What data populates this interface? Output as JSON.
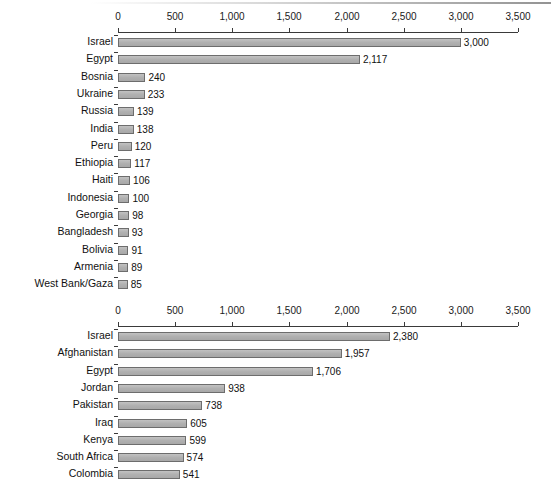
{
  "figure": {
    "background": "#ffffff",
    "bar_fill": "#b4b4b4",
    "bar_stroke": "#6d6d6d",
    "axis_color": "#3a3a3a"
  },
  "chart_data": [
    {
      "type": "bar",
      "orientation": "horizontal",
      "title": "",
      "xlabel": "",
      "ylabel": "",
      "xlim": [
        0,
        3500
      ],
      "grid": false,
      "legend": null,
      "tick_labels": [
        "0",
        "500",
        "1,000",
        "1,500",
        "2,000",
        "2,500",
        "3,000",
        "3,500"
      ],
      "ticks": [
        0,
        500,
        1000,
        1500,
        2000,
        2500,
        3000,
        3500
      ],
      "categories": [
        "Israel",
        "Egypt",
        "Bosnia",
        "Ukraine",
        "Russia",
        "India",
        "Peru",
        "Ethiopia",
        "Haiti",
        "Indonesia",
        "Georgia",
        "Bangladesh",
        "Bolivia",
        "Armenia",
        "West Bank/Gaza"
      ],
      "values": [
        3000,
        2117,
        240,
        233,
        139,
        138,
        120,
        117,
        106,
        100,
        98,
        93,
        91,
        89,
        85
      ],
      "value_labels": [
        "3,000",
        "2,117",
        "240",
        "233",
        "139",
        "138",
        "120",
        "117",
        "106",
        "100",
        "98",
        "93",
        "91",
        "89",
        "85"
      ]
    },
    {
      "type": "bar",
      "orientation": "horizontal",
      "title": "",
      "xlabel": "",
      "ylabel": "",
      "xlim": [
        0,
        3500
      ],
      "grid": false,
      "legend": null,
      "tick_labels": [
        "0",
        "500",
        "1,000",
        "1,500",
        "2,000",
        "2,500",
        "3,000",
        "3,500"
      ],
      "ticks": [
        0,
        500,
        1000,
        1500,
        2000,
        2500,
        3000,
        3500
      ],
      "categories": [
        "Israel",
        "Afghanistan",
        "Egypt",
        "Jordan",
        "Pakistan",
        "Iraq",
        "Kenya",
        "South Africa",
        "Colombia"
      ],
      "values": [
        2380,
        1957,
        1706,
        938,
        738,
        605,
        599,
        574,
        541
      ],
      "value_labels": [
        "2,380",
        "1,957",
        "1,706",
        "938",
        "738",
        "605",
        "599",
        "574",
        "541"
      ]
    }
  ]
}
